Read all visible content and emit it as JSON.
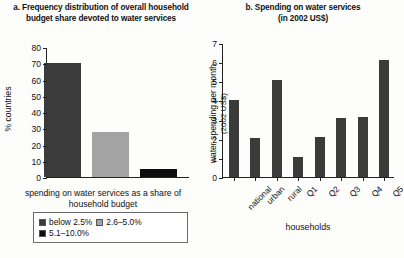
{
  "figure": {
    "background": "#fdfdfc",
    "colors": {
      "dark_gray": "#3b3b3b",
      "light_gray": "#a3a3a3",
      "black": "#0d0d0d",
      "axis": "#222222",
      "text": "#111111"
    }
  },
  "panel_a": {
    "title": "a. Frequency distribution of overall household budget share devoted to water services",
    "ylabel": "% countries",
    "xcaption": "spending on water services as a share of household budget",
    "yticks": [
      "0",
      "10",
      "20",
      "30",
      "40",
      "50",
      "60",
      "70",
      "80"
    ],
    "legend": [
      {
        "label": "below 2.5%",
        "color": "#3b3b3b"
      },
      {
        "label": "2.6–5.0%",
        "color": "#a3a3a3"
      },
      {
        "label": "5.1–10.0%",
        "color": "#0d0d0d"
      }
    ]
  },
  "panel_b": {
    "title": "b. Spending on water services (in 2002 US$)",
    "title_line1": "b. Spending on water services",
    "title_line2": "(in 2002 US$)",
    "ylabel_line1": "water spending per month",
    "ylabel_line2": "(2002 US$)",
    "xcaption": "households",
    "yticks": [
      "0",
      "1",
      "2",
      "3",
      "4",
      "5",
      "6",
      "7"
    ]
  },
  "chart_data": [
    {
      "type": "bar",
      "id": "panel_a",
      "title": "a. Frequency distribution of overall household budget share devoted to water services",
      "xlabel": "spending on water services as a share of household budget",
      "ylabel": "% countries",
      "ylim": [
        0,
        80
      ],
      "ytick_step": 10,
      "grid": false,
      "legend_position": "below-axis",
      "categories": [
        "below 2.5%",
        "2.6–5.0%",
        "5.1–10.0%"
      ],
      "values": [
        70,
        28,
        5
      ],
      "colors": [
        "#3b3b3b",
        "#a3a3a3",
        "#0d0d0d"
      ]
    },
    {
      "type": "bar",
      "id": "panel_b",
      "title": "b. Spending on water services (in 2002 US$)",
      "xlabel": "households",
      "ylabel": "water spending per month (2002 US$)",
      "ylim": [
        0,
        7
      ],
      "ytick_step": 1,
      "grid": false,
      "legend_position": "none",
      "categories": [
        "national",
        "urban",
        "rural",
        "Q1",
        "Q2",
        "Q3",
        "Q4",
        "Q5"
      ],
      "values": [
        4.0,
        2.05,
        5.05,
        1.05,
        2.1,
        3.1,
        3.12,
        6.1
      ],
      "colors": [
        "#3b3b3b",
        "#3b3b3b",
        "#3b3b3b",
        "#3b3b3b",
        "#3b3b3b",
        "#3b3b3b",
        "#3b3b3b",
        "#3b3b3b"
      ]
    }
  ]
}
